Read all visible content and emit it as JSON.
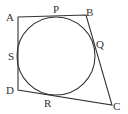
{
  "diagram": {
    "type": "quadrilateral-with-inscribed-circle",
    "stroke_color": "#333333",
    "background": "#ffffff",
    "vertices": [
      {
        "label": "A",
        "x": 18,
        "y": 17
      },
      {
        "label": "B",
        "x": 86,
        "y": 15
      },
      {
        "label": "C",
        "x": 112,
        "y": 105
      },
      {
        "label": "D",
        "x": 18,
        "y": 90
      }
    ],
    "circle": {
      "cx": 56,
      "cy": 56,
      "r": 39
    },
    "tangent_points": [
      {
        "label": "P",
        "x": 56,
        "y": 17
      },
      {
        "label": "Q",
        "x": 95,
        "y": 52
      },
      {
        "label": "R",
        "x": 48,
        "y": 95
      },
      {
        "label": "S",
        "x": 18,
        "y": 56
      }
    ],
    "labels": {
      "A": "A",
      "B": "B",
      "C": "C",
      "D": "D",
      "P": "P",
      "Q": "Q",
      "R": "R",
      "S": "S"
    }
  }
}
